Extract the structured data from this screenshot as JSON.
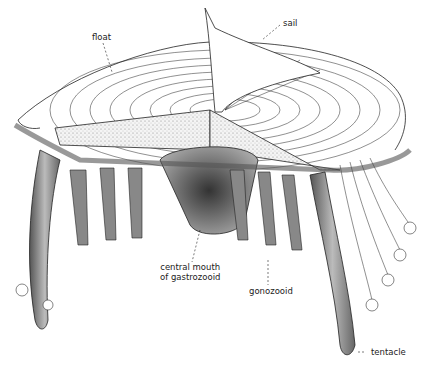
{
  "diagram": {
    "labels": {
      "float": "float",
      "sail": "sail",
      "mouth_line1": "central mouth",
      "mouth_line2": "of gastrozooid",
      "gonozooid": "gonozooid",
      "tentacle": "tentacle"
    }
  }
}
